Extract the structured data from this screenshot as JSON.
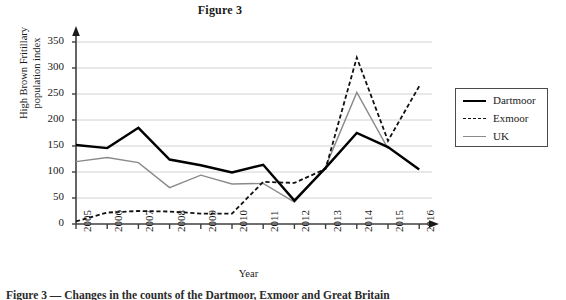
{
  "figure": {
    "title": "Figure 3",
    "caption": "Figure 3 — Changes in the counts of the Dartmoor, Exmoor and Great Britain"
  },
  "axes": {
    "y_title_line1": "High Brown Fritillary",
    "y_title_line2": "population index",
    "x_title": "Year",
    "y_ticks": [
      "0",
      "50",
      "100",
      "150",
      "200",
      "250",
      "300",
      "350"
    ],
    "x_ticks": [
      "2005",
      "2006",
      "2007",
      "2008",
      "2009",
      "2010",
      "2011",
      "2012",
      "2013",
      "2014",
      "2015",
      "2016"
    ]
  },
  "legend": {
    "position": "right",
    "items": [
      {
        "label": "Dartmoor",
        "style": "solid-thick",
        "color": "#000000",
        "swatch_icon": "solid-line-icon"
      },
      {
        "label": "Exmoor",
        "style": "dashed",
        "color": "#111111",
        "swatch_icon": "dashed-line-icon"
      },
      {
        "label": "UK",
        "style": "solid-thin",
        "color": "#8a8a8a",
        "swatch_icon": "thin-line-icon"
      }
    ]
  },
  "chart_data": {
    "type": "line",
    "title": "Figure 3",
    "xlabel": "Year",
    "ylabel": "High Brown Fritillary population index",
    "categories": [
      "2005",
      "2006",
      "2007",
      "2008",
      "2009",
      "2010",
      "2011",
      "2012",
      "2013",
      "2014",
      "2015",
      "2016"
    ],
    "ylim": [
      0,
      360
    ],
    "ytick_step": 50,
    "grid": "horizontal",
    "legend_position": "right",
    "series": [
      {
        "name": "Dartmoor",
        "color": "#000000",
        "style": "solid",
        "width": 2.4,
        "values": [
          152,
          146,
          185,
          124,
          113,
          99,
          114,
          45,
          108,
          175,
          148,
          105
        ]
      },
      {
        "name": "Exmoor",
        "color": "#111111",
        "style": "dashed",
        "width": 1.8,
        "values": [
          5,
          22,
          25,
          24,
          20,
          20,
          81,
          79,
          106,
          320,
          160,
          265
        ]
      },
      {
        "name": "UK",
        "color": "#8a8a8a",
        "style": "solid",
        "width": 1.4,
        "values": [
          120,
          128,
          118,
          70,
          94,
          77,
          78,
          42,
          110,
          253,
          145,
          null
        ]
      }
    ]
  }
}
